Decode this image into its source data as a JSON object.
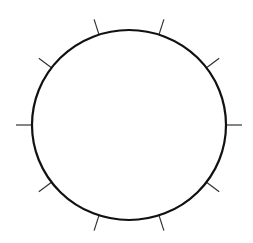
{
  "diagram": {
    "type": "circle-with-ticks",
    "width": 253,
    "height": 243,
    "background": "#ffffff",
    "circle": {
      "cx": 129,
      "cy": 125,
      "rx": 97,
      "ry": 95,
      "stroke": "#111111",
      "stroke_width": 2.2
    },
    "ticks": {
      "count": 10,
      "angles_deg": [
        0,
        37,
        72,
        108,
        143,
        180,
        217,
        252,
        288,
        323
      ],
      "length": 16,
      "stroke": "#333333",
      "stroke_width": 1.2
    }
  }
}
